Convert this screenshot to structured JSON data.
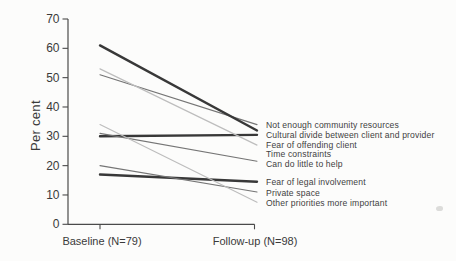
{
  "chart_data": {
    "type": "line",
    "subtype": "slopegraph",
    "title": "",
    "xlabel": "",
    "ylabel": "Per cent",
    "ylim": [
      0,
      70
    ],
    "y_ticks": [
      0,
      10,
      20,
      30,
      40,
      50,
      60,
      70
    ],
    "x_categories": [
      "Baseline (N=79)",
      "Follow-up (N=98)"
    ],
    "grid": false,
    "label_position": "right-of-line-ends",
    "series": [
      {
        "name": "Not enough community resources",
        "values": [
          51,
          34
        ],
        "weight": "normal"
      },
      {
        "name": "Cultural divide between client and provider",
        "values": [
          61,
          32
        ],
        "weight": "bold"
      },
      {
        "name": "Fear of offending client",
        "values": [
          30,
          30.5
        ],
        "weight": "bold"
      },
      {
        "name": "Time constraints",
        "values": [
          53,
          27
        ],
        "weight": "light"
      },
      {
        "name": "Can do little to help",
        "values": [
          31,
          21.5
        ],
        "weight": "normal"
      },
      {
        "name": "Fear of legal involvement",
        "values": [
          17,
          14.5
        ],
        "weight": "bold"
      },
      {
        "name": "Private space",
        "values": [
          20,
          11
        ],
        "weight": "normal"
      },
      {
        "name": "Other priorities more important",
        "values": [
          34,
          7.5
        ],
        "weight": "light"
      }
    ],
    "colors": {
      "bold": "#383838",
      "normal": "#757575",
      "light": "#bdbdbd",
      "axis": "#4a4a4a",
      "text": "#3a3a3a"
    }
  }
}
